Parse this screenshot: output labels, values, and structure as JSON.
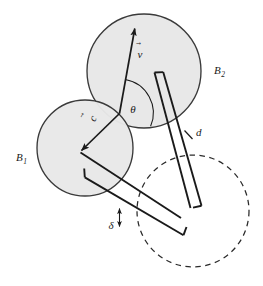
{
  "figure": {
    "type": "geometry-diagram",
    "background_color": "#ffffff",
    "stroke_color": "#1a1a1a",
    "disk_fill_color": "#e8e8e8",
    "disk_stroke_color": "#3a3a3a",
    "dashed_stroke_color": "#2a2a2a"
  },
  "labels": {
    "disk_top": {
      "base": "B",
      "subscript": "2",
      "x": 214,
      "y": 74
    },
    "disk_left": {
      "base": "B",
      "subscript": "1",
      "x": 16,
      "y": 161
    },
    "vector_velocity": {
      "base": "v",
      "accent": "⃗",
      "x": 140,
      "y": 58
    },
    "vector_center": {
      "base": "c",
      "accent": "⃗",
      "x": 96,
      "y": 120
    },
    "angle_theta": {
      "base": "θ",
      "x": 133,
      "y": 113
    },
    "distance_d": {
      "base": "d",
      "x": 196,
      "y": 136
    },
    "clearance_delta": {
      "base": "δ",
      "x": 111,
      "y": 229
    }
  },
  "shapes": {
    "disk_top": {
      "cx": 144,
      "cy": 71,
      "r": 57,
      "fill": "#e8e8e8",
      "stroke": "#3a3a3a",
      "style": "solid"
    },
    "disk_left": {
      "cx": 85,
      "cy": 148,
      "r": 48,
      "fill": "#e8e8e8",
      "stroke": "#3a3a3a",
      "style": "solid"
    },
    "disk_projected": {
      "cx": 193,
      "cy": 211,
      "r": 56,
      "fill": "none",
      "stroke": "#2a2a2a",
      "style": "dashed"
    }
  },
  "vectors": {
    "velocity": {
      "from_x": 119,
      "from_y": 113,
      "to_x": 135,
      "to_y": 26,
      "label": "v"
    },
    "center_offset": {
      "from_x": 119,
      "from_y": 113,
      "to_x": 80,
      "to_y": 152,
      "label": "c"
    }
  },
  "angle_arc": {
    "vertex_x": 119,
    "vertex_y": 113,
    "radius": 34,
    "between": [
      "velocity",
      "ray-to-lower-right"
    ]
  },
  "brackets": {
    "upper": {
      "name": "d-bracket",
      "start_x": 154,
      "start_y": 72,
      "end_x": 200,
      "end_y": 206,
      "cap_length": 9,
      "label": "d"
    },
    "lower": {
      "name": "delta-bracket",
      "start_x": 84,
      "start_y": 168,
      "end_x": 181,
      "end_y": 226,
      "cap_length": 9,
      "label": "δ"
    }
  },
  "measurement_ticks": {
    "d_tick": {
      "x1": 185,
      "y1": 131,
      "x2": 193,
      "y2": 139
    },
    "delta_arrow": {
      "x1": 119,
      "y1": 227,
      "x2": 119,
      "y2": 209
    }
  }
}
